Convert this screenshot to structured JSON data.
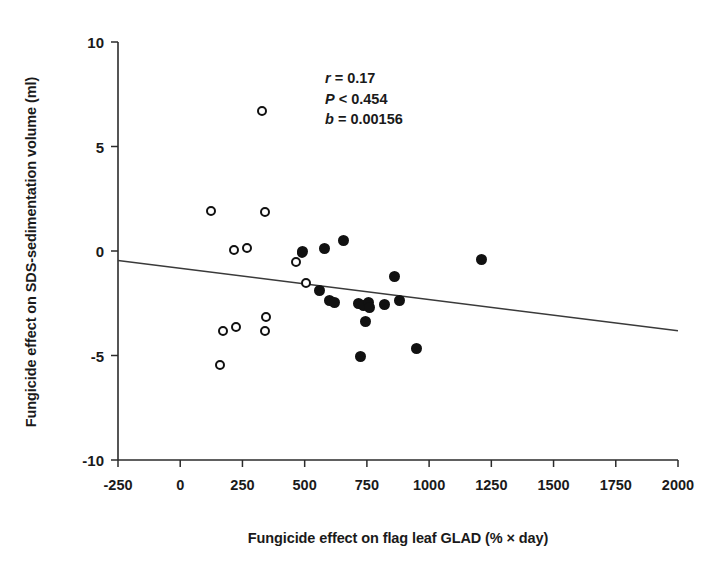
{
  "chart_data": {
    "type": "scatter",
    "title": "",
    "xlabel": "Fungicide effect on flag leaf GLAD (% × day)",
    "ylabel": "Fungicide effect on SDS-sedimentation volume (ml)",
    "xlim": [
      -250,
      2000
    ],
    "ylim": [
      -10,
      10
    ],
    "xticks": [
      -250,
      0,
      250,
      500,
      750,
      1000,
      1250,
      1500,
      1750,
      2000
    ],
    "xtick_labels": [
      "-250",
      "0",
      "250",
      "500",
      "750",
      "1000",
      "1250",
      "1500",
      "1750",
      "2000"
    ],
    "yticks": [
      -10,
      -5,
      0,
      5,
      10
    ],
    "ytick_labels": [
      "-10",
      "-5",
      "0",
      "5",
      "10"
    ],
    "grid": false,
    "legend": "none",
    "annotations": [
      {
        "symbol": "r",
        "operator": "=",
        "value": "0.17"
      },
      {
        "symbol": "P",
        "operator": "<",
        "value": "0.454"
      },
      {
        "symbol": "b",
        "operator": "=",
        "value": "0.00156"
      }
    ],
    "trendline": {
      "x": [
        -250,
        2000
      ],
      "y": [
        -0.45,
        -3.82
      ],
      "slope": -0.0015,
      "intercept": -0.83
    },
    "series": [
      {
        "name": "open-circles",
        "marker": "open-circle",
        "color": "#111111",
        "points": [
          [
            125,
            1.9
          ],
          [
            330,
            6.7
          ],
          [
            340,
            1.85
          ],
          [
            215,
            0.05
          ],
          [
            270,
            0.15
          ],
          [
            465,
            -0.55
          ],
          [
            170,
            -3.85
          ],
          [
            225,
            -3.65
          ],
          [
            345,
            -3.15
          ],
          [
            340,
            -3.85
          ],
          [
            160,
            -5.45
          ],
          [
            490,
            -0.1
          ],
          [
            505,
            -1.55
          ]
        ]
      },
      {
        "name": "filled-circles",
        "marker": "filled-circle",
        "color": "#111111",
        "points": [
          [
            580,
            0.1
          ],
          [
            655,
            0.5
          ],
          [
            490,
            0.0
          ],
          [
            560,
            -1.9
          ],
          [
            600,
            -2.35
          ],
          [
            620,
            -2.45
          ],
          [
            715,
            -2.5
          ],
          [
            735,
            -2.6
          ],
          [
            755,
            -2.45
          ],
          [
            760,
            -2.7
          ],
          [
            745,
            -3.35
          ],
          [
            860,
            -1.2
          ],
          [
            880,
            -2.35
          ],
          [
            725,
            -5.05
          ],
          [
            950,
            -4.65
          ],
          [
            1210,
            -0.4
          ],
          [
            820,
            -2.55
          ]
        ]
      }
    ]
  }
}
